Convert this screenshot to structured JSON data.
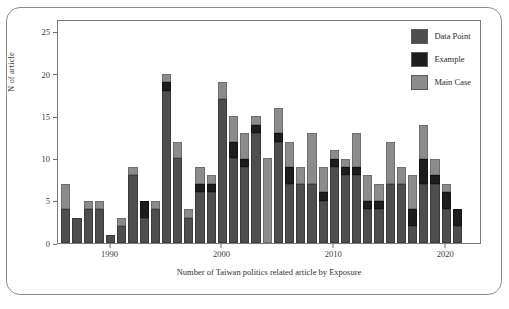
{
  "chart_data": {
    "type": "bar",
    "stacked": true,
    "title": "",
    "xlabel": "Number of Taiwan politics related article by Exposure",
    "ylabel": "N of article",
    "ylim": [
      0,
      26.5
    ],
    "xlim": [
      1985.3,
      2023.2
    ],
    "grid": false,
    "legend_position": "top-right",
    "y_ticks": [
      0,
      5,
      10,
      15,
      20,
      25
    ],
    "x_ticks": [
      1990,
      2000,
      2010,
      2020
    ],
    "series": [
      {
        "name": "Data Point",
        "color": "#4e4e4e",
        "values": [
          4,
          3,
          4,
          4,
          1,
          2,
          8,
          3,
          4,
          18,
          10,
          3,
          6,
          6,
          17,
          10,
          9,
          13,
          0,
          12,
          7,
          7,
          7,
          5,
          9,
          8,
          8,
          4,
          4,
          7,
          7,
          2,
          7,
          7,
          4,
          2
        ]
      },
      {
        "name": "Example",
        "color": "#1d1d1d",
        "values": [
          0,
          0,
          0,
          0,
          0,
          0,
          0,
          2,
          0,
          1,
          0,
          0,
          1,
          1,
          0,
          2,
          1,
          1,
          0,
          1,
          2,
          0,
          0,
          1,
          1,
          1,
          1,
          1,
          1,
          0,
          0,
          2,
          3,
          1,
          2,
          2
        ]
      },
      {
        "name": "Main Case",
        "color": "#8c8c8c",
        "values": [
          3,
          0,
          1,
          1,
          0,
          1,
          1,
          0,
          1,
          1,
          2,
          1,
          2,
          1,
          2,
          3,
          3,
          1,
          10,
          3,
          3,
          2,
          6,
          3,
          1,
          1,
          4,
          3,
          2,
          5,
          2,
          4,
          4,
          2,
          1,
          0
        ]
      }
    ],
    "categories": [
      1986,
      1987,
      1988,
      1989,
      1990,
      1991,
      1992,
      1993,
      1994,
      1995,
      1996,
      1997,
      1998,
      1999,
      2000,
      2001,
      2002,
      2003,
      2004,
      2005,
      2006,
      2007,
      2008,
      2009,
      2010,
      2011,
      2012,
      2013,
      2014,
      2015,
      2016,
      2017,
      2018,
      2019,
      2020,
      2021
    ],
    "totals": [
      7,
      3,
      5,
      5,
      1,
      3,
      9,
      5,
      5,
      20,
      12,
      4,
      9,
      8,
      19,
      15,
      13,
      15,
      10,
      16,
      12,
      9,
      13,
      9,
      11,
      10,
      13,
      8,
      7,
      12,
      9,
      8,
      14,
      10,
      7,
      4
    ]
  },
  "legend": {
    "items": [
      {
        "label": "Data Point",
        "color": "#4e4e4e"
      },
      {
        "label": "Example",
        "color": "#1d1d1d"
      },
      {
        "label": "Main Case",
        "color": "#8c8c8c"
      }
    ]
  }
}
